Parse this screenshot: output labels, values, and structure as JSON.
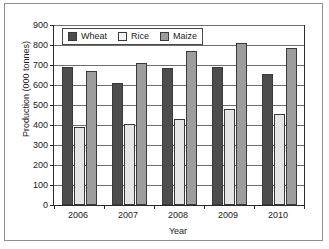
{
  "chart_data": {
    "type": "bar",
    "title": "",
    "xlabel": "Year",
    "ylabel": "Production (000 tonnes)",
    "categories": [
      "2006",
      "2007",
      "2008",
      "2009",
      "2010"
    ],
    "series": [
      {
        "name": "Wheat",
        "color": "#4d4d4d",
        "values": [
          690,
          608,
          685,
          688,
          655
        ]
      },
      {
        "name": "Rice",
        "color": "#e6e6e6",
        "values": [
          390,
          403,
          432,
          478,
          453
        ]
      },
      {
        "name": "Maize",
        "color": "#9d9d9d",
        "values": [
          672,
          712,
          772,
          812,
          785
        ]
      }
    ],
    "ylim": [
      0,
      900
    ],
    "ytick_step": 100,
    "yticks": [
      "900",
      "800",
      "700",
      "600",
      "500",
      "400",
      "300",
      "200",
      "100",
      "0"
    ],
    "grid": true,
    "legend_position": "top-left-inside",
    "legend_entries": [
      "Wheat",
      "Rice",
      "Maize"
    ]
  },
  "figure": {
    "border_color": "#8f8f8f",
    "background": "#ffffff"
  }
}
